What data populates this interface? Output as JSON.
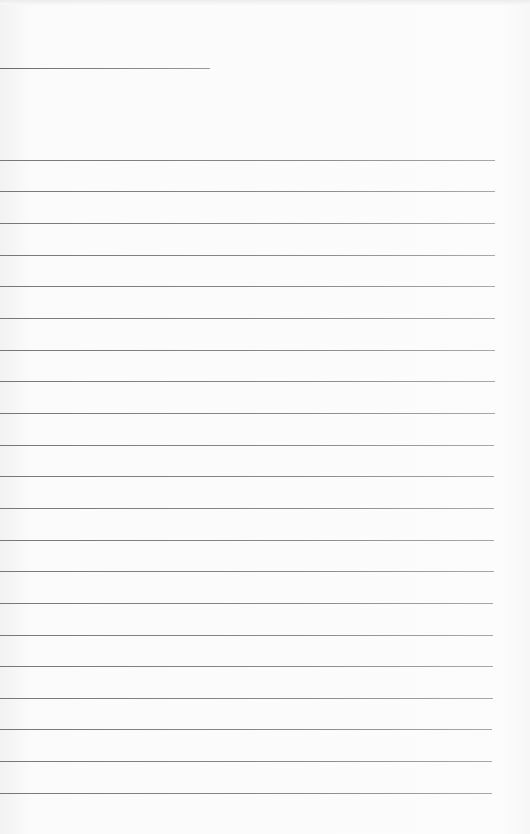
{
  "document": {
    "type": "blank ruled page",
    "header_line": {
      "y": 68,
      "x_start": 0,
      "x_end": 210
    },
    "ruled_lines": [
      {
        "y": 160,
        "x_end": 495
      },
      {
        "y": 191,
        "x_end": 495
      },
      {
        "y": 223,
        "x_end": 495
      },
      {
        "y": 255,
        "x_end": 495
      },
      {
        "y": 286,
        "x_end": 495
      },
      {
        "y": 318,
        "x_end": 495
      },
      {
        "y": 350,
        "x_end": 495
      },
      {
        "y": 381,
        "x_end": 495
      },
      {
        "y": 413,
        "x_end": 495
      },
      {
        "y": 445,
        "x_end": 494
      },
      {
        "y": 476,
        "x_end": 494
      },
      {
        "y": 508,
        "x_end": 494
      },
      {
        "y": 540,
        "x_end": 494
      },
      {
        "y": 571,
        "x_end": 494
      },
      {
        "y": 603,
        "x_end": 493
      },
      {
        "y": 635,
        "x_end": 493
      },
      {
        "y": 666,
        "x_end": 493
      },
      {
        "y": 698,
        "x_end": 493
      },
      {
        "y": 729,
        "x_end": 492
      },
      {
        "y": 761,
        "x_end": 492
      },
      {
        "y": 793,
        "x_end": 492
      }
    ]
  }
}
